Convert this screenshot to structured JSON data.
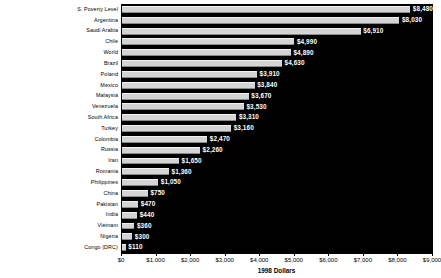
{
  "chart_data": {
    "type": "bar",
    "orientation": "horizontal",
    "title": "",
    "xlabel": "1998 Dollars",
    "ylabel": "",
    "xlim": [
      0,
      9000
    ],
    "xticks": [
      0,
      1000,
      2000,
      3000,
      4000,
      5000,
      6000,
      7000,
      8000,
      9000
    ],
    "xticklabels": [
      "$0",
      "$1,000",
      "$2,000",
      "$3,000",
      "$4,000",
      "$5,000",
      "$6,000",
      "$7,000",
      "$8,000",
      "$9,000"
    ],
    "grid": false,
    "legend": "none",
    "plot_background": "#000000",
    "bar_color": "#d4d4d4",
    "value_label_color": "#ffffff",
    "categories": [
      "S. Poverty Level",
      "Argentina",
      "Saudi Arabia",
      "Chile",
      "World",
      "Brazil",
      "Poland",
      "Mexico",
      "Malaysia",
      "Venezuela",
      "South Africa",
      "Turkey",
      "Colombia",
      "Russia",
      "Iran",
      "Romania",
      "Philippines",
      "China",
      "Pakistan",
      "India",
      "Vietnam",
      "Nigeria",
      "Congo (DRC)"
    ],
    "values": [
      8480,
      8030,
      6910,
      4990,
      4890,
      4630,
      3910,
      3840,
      3670,
      3530,
      3310,
      3160,
      2470,
      2260,
      1650,
      1360,
      1050,
      750,
      470,
      440,
      360,
      300,
      110
    ],
    "value_labels": [
      "$8,480",
      "$8,030",
      "$6,910",
      "$4,990",
      "$4,890",
      "$4,630",
      "$3,910",
      "$3,840",
      "$3,670",
      "$3,530",
      "$3,310",
      "$3,160",
      "$2,470",
      "$2,260",
      "$1,650",
      "$1,360",
      "$1,050",
      "$750",
      "$470",
      "$440",
      "$360",
      "$300",
      "$110"
    ]
  }
}
